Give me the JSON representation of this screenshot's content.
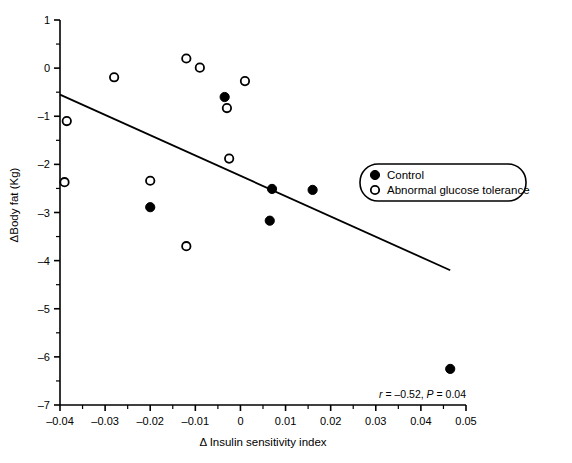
{
  "chart_data": {
    "type": "scatter",
    "title": "",
    "xlabel": "Δ Insulin sensitivity index",
    "ylabel": "ΔBody fat (Kg)",
    "xlim": [
      -0.04,
      0.05
    ],
    "ylim": [
      -7,
      1
    ],
    "xticks": [
      "-0.04",
      "-0.03",
      "-0.02",
      "-0.01",
      "0",
      "0.01",
      "0.02",
      "0.03",
      "0.04",
      "0.05"
    ],
    "xtick_values": [
      -0.04,
      -0.03,
      -0.02,
      -0.01,
      0,
      0.01,
      0.02,
      0.03,
      0.04,
      0.05
    ],
    "yticks": [
      "1",
      "0",
      "-1",
      "-2",
      "-3",
      "-4",
      "-5",
      "-6",
      "-7"
    ],
    "ytick_values": [
      1,
      0,
      -1,
      -2,
      -3,
      -4,
      -5,
      -6,
      -7
    ],
    "grid": false,
    "legend_position": "right-middle",
    "series": [
      {
        "name": "Control",
        "marker": "filled-circle",
        "color": "#000000",
        "points": [
          {
            "x": -0.02,
            "y": -2.89
          },
          {
            "x": -0.0035,
            "y": -0.6
          },
          {
            "x": 0.007,
            "y": -2.51
          },
          {
            "x": 0.0065,
            "y": -3.17
          },
          {
            "x": 0.016,
            "y": -2.53
          },
          {
            "x": 0.0465,
            "y": -6.25
          }
        ]
      },
      {
        "name": "Abnormal glucose tolerance",
        "marker": "open-circle",
        "color": "#000000",
        "points": [
          {
            "x": -0.0385,
            "y": -1.1
          },
          {
            "x": -0.039,
            "y": -2.37
          },
          {
            "x": -0.028,
            "y": -0.19
          },
          {
            "x": -0.02,
            "y": -2.34
          },
          {
            "x": -0.012,
            "y": 0.2
          },
          {
            "x": -0.012,
            "y": -3.7
          },
          {
            "x": -0.009,
            "y": 0.01
          },
          {
            "x": -0.003,
            "y": -0.83
          },
          {
            "x": -0.0025,
            "y": -1.88
          },
          {
            "x": 0.001,
            "y": -0.27
          }
        ]
      }
    ],
    "regression_line": {
      "x_start": -0.04,
      "y_start": -0.55,
      "x_end": 0.0465,
      "y_end": -4.2,
      "r": "-0.52",
      "p": "0.04"
    },
    "annotations": [
      {
        "name": "correlation-stats",
        "r_symbol": "r",
        "r_equals": " = –0.52, ",
        "p_symbol": "P",
        "p_equals": " = 0.04",
        "full_text": "r = –0.52, P = 0.04"
      }
    ]
  },
  "legend": {
    "items": [
      {
        "label": "Control",
        "marker": "filled-circle"
      },
      {
        "label": "Abnormal glucose tolerance",
        "marker": "open-circle"
      }
    ]
  },
  "axes": {
    "x_title": "Δ Insulin sensitivity index",
    "y_title": "ΔBody fat (Kg)"
  }
}
